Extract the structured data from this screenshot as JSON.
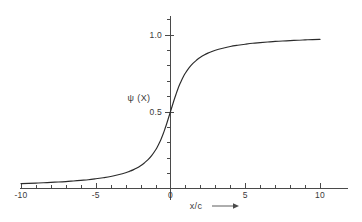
{
  "figure": {
    "background_color": "#ffffff",
    "curve_color": "#2b2b2b",
    "axis_color": "#4a4a4a",
    "text_color": "#3a3a3a"
  },
  "chart_data": {
    "type": "line",
    "title": "",
    "subtitle": "",
    "xlabel": "x/c",
    "xlabel_arrow": "⟶",
    "ylabel": "ψ (X)",
    "xlim": [
      -10.8,
      12.2
    ],
    "ylim": [
      -0.06,
      1.18
    ],
    "grid": false,
    "legend": null,
    "x_ticks_major": [
      -10,
      -5,
      0,
      5,
      10
    ],
    "x_tick_labels": [
      "-10",
      "-5",
      "0",
      "5",
      "10"
    ],
    "x_ticks_minor": [
      -9,
      -8,
      -7,
      -6,
      -4,
      -3,
      -2,
      -1,
      1,
      2,
      3,
      4,
      6,
      7,
      8,
      9
    ],
    "y_ticks_major": [
      0.5,
      1.0
    ],
    "y_tick_labels": [
      "0.5",
      "1.0"
    ],
    "y_ticks_minor": [
      0.1,
      0.2,
      0.3,
      0.4,
      0.6,
      0.7,
      0.8,
      0.9,
      1.1
    ],
    "series": [
      {
        "name": "ψ (X)",
        "x": [
          -10.0,
          -9.5,
          -9.0,
          -8.5,
          -8.0,
          -7.5,
          -7.0,
          -6.5,
          -6.0,
          -5.5,
          -5.0,
          -4.5,
          -4.0,
          -3.5,
          -3.0,
          -2.75,
          -2.5,
          -2.25,
          -2.0,
          -1.75,
          -1.5,
          -1.25,
          -1.0,
          -0.875,
          -0.75,
          -0.625,
          -0.5,
          -0.375,
          -0.25,
          -0.125,
          0.0,
          0.125,
          0.25,
          0.375,
          0.5,
          0.625,
          0.75,
          0.875,
          1.0,
          1.25,
          1.5,
          1.75,
          2.0,
          2.25,
          2.5,
          2.75,
          3.0,
          3.5,
          4.0,
          4.5,
          5.0,
          5.5,
          6.0,
          6.5,
          7.0,
          7.5,
          8.0,
          8.5,
          9.0,
          9.5,
          10.0
        ],
        "y": [
          0.032,
          0.033,
          0.035,
          0.037,
          0.04,
          0.042,
          0.045,
          0.049,
          0.053,
          0.057,
          0.063,
          0.07,
          0.078,
          0.089,
          0.102,
          0.111,
          0.121,
          0.133,
          0.148,
          0.166,
          0.187,
          0.215,
          0.25,
          0.271,
          0.295,
          0.322,
          0.352,
          0.386,
          0.422,
          0.461,
          0.5,
          0.539,
          0.578,
          0.614,
          0.648,
          0.678,
          0.705,
          0.729,
          0.75,
          0.785,
          0.813,
          0.834,
          0.852,
          0.867,
          0.879,
          0.889,
          0.898,
          0.911,
          0.922,
          0.93,
          0.937,
          0.943,
          0.947,
          0.951,
          0.955,
          0.958,
          0.96,
          0.963,
          0.965,
          0.967,
          0.968
        ],
        "color": "#2b2b2b",
        "style": "solid",
        "width": 1.15
      }
    ],
    "annotations": [],
    "function_note": ""
  }
}
